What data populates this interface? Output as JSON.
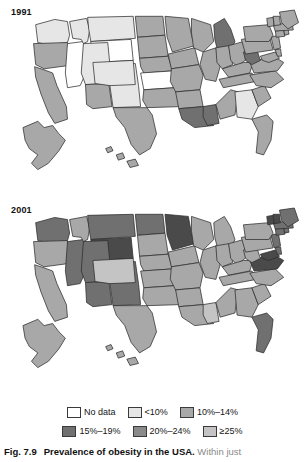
{
  "figure": {
    "caption_number": "Fig. 7.9",
    "caption_title": "Prevalence of obesity in the USA.",
    "caption_rest": " Within just"
  },
  "legend": {
    "rows": [
      [
        {
          "label": "No data",
          "color": "#ffffff"
        },
        {
          "label": "<10%",
          "color": "#e6e6e6"
        },
        {
          "label": "10%–14%",
          "color": "#a8a8a8"
        }
      ],
      [
        {
          "label": "15%–19%",
          "color": "#707070"
        },
        {
          "label": "20%–24%",
          "color": "#8a8a8a"
        },
        {
          "label": "≥25%",
          "color": "#c4c4c4"
        }
      ]
    ]
  },
  "maps": [
    {
      "year": "1991",
      "states": {
        "WA": "#e6e6e6",
        "OR": "#a8a8a8",
        "CA": "#a8a8a8",
        "NV": "#ffffff",
        "ID": "#e6e6e6",
        "MT": "#e6e6e6",
        "WY": "#ffffff",
        "UT": "#e6e6e6",
        "AZ": "#a8a8a8",
        "NM": "#e6e6e6",
        "CO": "#e6e6e6",
        "ND": "#a8a8a8",
        "SD": "#a8a8a8",
        "NE": "#a8a8a8",
        "KS": "#ffffff",
        "OK": "#a8a8a8",
        "TX": "#a8a8a8",
        "MN": "#a8a8a8",
        "IA": "#a8a8a8",
        "MO": "#a8a8a8",
        "AR": "#a8a8a8",
        "LA": "#707070",
        "WI": "#a8a8a8",
        "IL": "#a8a8a8",
        "MS": "#707070",
        "MI": "#707070",
        "IN": "#a8a8a8",
        "OH": "#a8a8a8",
        "KY": "#a8a8a8",
        "TN": "#a8a8a8",
        "AL": "#a8a8a8",
        "GA": "#e6e6e6",
        "FL": "#a8a8a8",
        "SC": "#a8a8a8",
        "NC": "#a8a8a8",
        "VA": "#a8a8a8",
        "WV": "#707070",
        "MD": "#a8a8a8",
        "DE": "#a8a8a8",
        "PA": "#a8a8a8",
        "NJ": "#a8a8a8",
        "NY": "#a8a8a8",
        "CT": "#a8a8a8",
        "RI": "#a8a8a8",
        "MA": "#a8a8a8",
        "VT": "#a8a8a8",
        "NH": "#a8a8a8",
        "ME": "#a8a8a8",
        "AK": "#a8a8a8",
        "HI": "#a8a8a8"
      }
    },
    {
      "year": "2001",
      "states": {
        "WA": "#707070",
        "OR": "#a8a8a8",
        "CA": "#a8a8a8",
        "NV": "#707070",
        "ID": "#a8a8a8",
        "MT": "#707070",
        "WY": "#4a4a4a",
        "UT": "#707070",
        "AZ": "#707070",
        "NM": "#707070",
        "CO": "#c4c4c4",
        "ND": "#707070",
        "SD": "#a8a8a8",
        "NE": "#a8a8a8",
        "KS": "#a8a8a8",
        "OK": "#a8a8a8",
        "TX": "#a8a8a8",
        "MN": "#4a4a4a",
        "IA": "#a8a8a8",
        "MO": "#a8a8a8",
        "AR": "#a8a8a8",
        "LA": "#a8a8a8",
        "WI": "#a8a8a8",
        "IL": "#a8a8a8",
        "MS": "#c4c4c4",
        "MI": "#a8a8a8",
        "IN": "#a8a8a8",
        "OH": "#a8a8a8",
        "KY": "#a8a8a8",
        "TN": "#a8a8a8",
        "AL": "#a8a8a8",
        "GA": "#a8a8a8",
        "FL": "#707070",
        "SC": "#a8a8a8",
        "NC": "#a8a8a8",
        "VA": "#4a4a4a",
        "WV": "#a8a8a8",
        "MD": "#4a4a4a",
        "DE": "#707070",
        "PA": "#a8a8a8",
        "NJ": "#707070",
        "NY": "#a8a8a8",
        "CT": "#707070",
        "RI": "#707070",
        "MA": "#707070",
        "VT": "#4a4a4a",
        "NH": "#4a4a4a",
        "ME": "#707070",
        "AK": "#a8a8a8",
        "HI": "#a8a8a8"
      }
    }
  ],
  "chart_data": {
    "type": "map",
    "title": "Prevalence of obesity in the USA",
    "subtitle": "",
    "map_region": "United States of America",
    "panels": [
      "1991",
      "2001"
    ],
    "legend_position": "bottom",
    "categories": [
      "No data",
      "<10%",
      "10%–14%",
      "15%–19%",
      "20%–24%",
      "≥25%"
    ],
    "category_colors": [
      "#ffffff",
      "#e6e6e6",
      "#a8a8a8",
      "#707070",
      "#8a8a8a",
      "#c4c4c4"
    ],
    "series": [
      {
        "name": "1991",
        "values": {
          "WA": "<10%",
          "OR": "10%–14%",
          "CA": "10%–14%",
          "NV": "No data",
          "ID": "<10%",
          "MT": "<10%",
          "WY": "No data",
          "UT": "<10%",
          "AZ": "10%–14%",
          "NM": "<10%",
          "CO": "<10%",
          "ND": "10%–14%",
          "SD": "10%–14%",
          "NE": "10%–14%",
          "KS": "No data",
          "OK": "10%–14%",
          "TX": "10%–14%",
          "MN": "10%–14%",
          "IA": "10%–14%",
          "MO": "10%–14%",
          "AR": "10%–14%",
          "LA": "15%–19%",
          "WI": "10%–14%",
          "IL": "10%–14%",
          "MS": "15%–19%",
          "MI": "15%–19%",
          "IN": "10%–14%",
          "OH": "10%–14%",
          "KY": "10%–14%",
          "TN": "10%–14%",
          "AL": "10%–14%",
          "GA": "<10%",
          "FL": "10%–14%",
          "SC": "10%–14%",
          "NC": "10%–14%",
          "VA": "10%–14%",
          "WV": "15%–19%",
          "MD": "10%–14%",
          "DE": "10%–14%",
          "PA": "10%–14%",
          "NJ": "10%–14%",
          "NY": "10%–14%",
          "CT": "10%–14%",
          "RI": "10%–14%",
          "MA": "10%–14%",
          "VT": "10%–14%",
          "NH": "10%–14%",
          "ME": "10%–14%",
          "AK": "10%–14%",
          "HI": "10%–14%"
        }
      },
      {
        "name": "2001",
        "values": {
          "WA": "15%–19%",
          "OR": "10%–14%",
          "CA": "10%–14%",
          "NV": "15%–19%",
          "ID": "10%–14%",
          "MT": "15%–19%",
          "WY": "20%–24%",
          "UT": "15%–19%",
          "AZ": "15%–19%",
          "NM": "15%–19%",
          "CO": "≥25%",
          "ND": "15%–19%",
          "SD": "10%–14%",
          "NE": "10%–14%",
          "KS": "10%–14%",
          "OK": "10%–14%",
          "TX": "10%–14%",
          "MN": "20%–24%",
          "IA": "10%–14%",
          "MO": "10%–14%",
          "AR": "10%–14%",
          "LA": "10%–14%",
          "WI": "10%–14%",
          "IL": "10%–14%",
          "MS": "≥25%",
          "MI": "10%–14%",
          "IN": "10%–14%",
          "OH": "10%–14%",
          "KY": "10%–14%",
          "TN": "10%–14%",
          "AL": "10%–14%",
          "GA": "10%–14%",
          "FL": "15%–19%",
          "SC": "10%–14%",
          "NC": "10%–14%",
          "VA": "20%–24%",
          "WV": "10%–14%",
          "MD": "20%–24%",
          "DE": "15%–19%",
          "PA": "10%–14%",
          "NJ": "15%–19%",
          "NY": "10%–14%",
          "CT": "15%–19%",
          "RI": "15%–19%",
          "MA": "15%–19%",
          "VT": "20%–24%",
          "NH": "20%–24%",
          "ME": "15%–19%",
          "AK": "10%–14%",
          "HI": "10%–14%"
        }
      }
    ]
  }
}
